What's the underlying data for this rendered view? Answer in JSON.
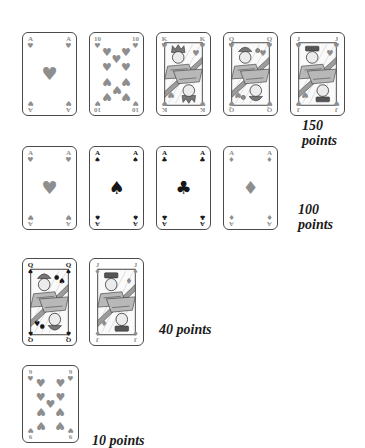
{
  "figure": {
    "background": "#ffffff",
    "colors": {
      "card_border": "#4a4a4a",
      "red_suit_gray": "#8e8e8e",
      "black_suit": "#161616",
      "label_text": "#1b1b1b",
      "face_frame": "#333333",
      "face_light": "#ececec",
      "face_mid": "#b8b8b8",
      "face_band": "#9c9c9c"
    },
    "suits": {
      "heart": "♥",
      "spade": "♠",
      "club": "♣",
      "diamond": "♦"
    },
    "rows": [
      {
        "cards": [
          {
            "rank": "A",
            "suit": "heart",
            "kind": "pip"
          },
          {
            "rank": "10",
            "suit": "heart",
            "kind": "pip"
          },
          {
            "rank": "K",
            "suit": "heart",
            "kind": "face"
          },
          {
            "rank": "Q",
            "suit": "heart",
            "kind": "face"
          },
          {
            "rank": "J",
            "suit": "heart",
            "kind": "face"
          }
        ],
        "label_lines": [
          "150",
          "points"
        ]
      },
      {
        "cards": [
          {
            "rank": "A",
            "suit": "heart",
            "kind": "pip"
          },
          {
            "rank": "A",
            "suit": "spade",
            "kind": "pip"
          },
          {
            "rank": "A",
            "suit": "club",
            "kind": "pip"
          },
          {
            "rank": "A",
            "suit": "diamond",
            "kind": "pip"
          }
        ],
        "label_lines": [
          "100",
          "points"
        ]
      },
      {
        "cards": [
          {
            "rank": "Q",
            "suit": "spade",
            "kind": "face"
          },
          {
            "rank": "J",
            "suit": "diamond",
            "kind": "face"
          }
        ],
        "label_lines": [
          "40 points"
        ]
      },
      {
        "cards": [
          {
            "rank": "9",
            "suit": "heart",
            "kind": "pip"
          }
        ],
        "label_lines": [
          "10 points"
        ]
      }
    ]
  }
}
